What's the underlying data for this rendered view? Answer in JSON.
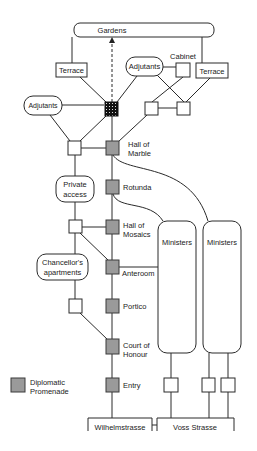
{
  "diagram": {
    "type": "building access graph",
    "top": {
      "gardens": "Gardens"
    },
    "nodes": {
      "terrace_left": "Terrace",
      "terrace_right": "Terrace",
      "adjutants_left": "Adjutants",
      "adjutants_right": "Adjutants",
      "cabinet": "Cabinet",
      "private_access": [
        "Private",
        "access"
      ],
      "chancellors_apartments": [
        "Chancellor's",
        "apartments"
      ],
      "ministers_1": "Ministers",
      "ministers_2": "Ministers"
    },
    "promenade": [
      {
        "id": "hall_of_marble",
        "label": [
          "Hall of",
          "Marble"
        ]
      },
      {
        "id": "rotunda",
        "label": [
          "Rotunda"
        ]
      },
      {
        "id": "hall_of_mosaics",
        "label": [
          "Hall of",
          "Mosaics"
        ]
      },
      {
        "id": "anteroom",
        "label": [
          "Anteroom"
        ]
      },
      {
        "id": "portico",
        "label": [
          "Portico"
        ]
      },
      {
        "id": "court_of_honour",
        "label": [
          "Court of",
          "Honour"
        ]
      },
      {
        "id": "entry",
        "label": [
          "Entry"
        ]
      }
    ],
    "streets": {
      "left": "Wilhelmstrasse",
      "right": "Voss Strasse"
    },
    "legend": {
      "label_line1": "Diplomatic",
      "label_line2": "Promenade",
      "swatch_color": "#9a9a9a"
    }
  }
}
